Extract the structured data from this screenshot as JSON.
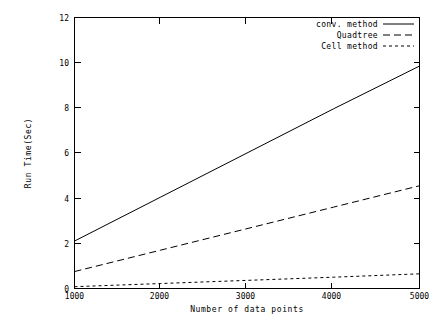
{
  "chart_data": {
    "type": "line",
    "title": "",
    "xlabel": "Number of data points",
    "ylabel": "Run Time(Sec)",
    "xlim": [
      1000,
      5000
    ],
    "ylim": [
      0,
      12
    ],
    "xticks": [
      1000,
      2000,
      3000,
      4000,
      5000
    ],
    "yticks": [
      0,
      2,
      4,
      6,
      8,
      10,
      12
    ],
    "xtick_labels": [
      "1000",
      "2000",
      "3000",
      "4000",
      "5000"
    ],
    "ytick_labels": [
      "0",
      "2",
      "4",
      "6",
      "8",
      "10",
      "12"
    ],
    "grid": false,
    "legend_position": "top-right",
    "x": [
      1000,
      2000,
      3000,
      4000,
      5000
    ],
    "series": [
      {
        "name": "conv. method",
        "style": "solid",
        "values": [
          2.1,
          4.05,
          6.0,
          7.95,
          9.85
        ]
      },
      {
        "name": "Quadtree",
        "style": "dashed",
        "values": [
          0.75,
          1.7,
          2.65,
          3.6,
          4.55
        ]
      },
      {
        "name": "Cell method",
        "style": "dotted",
        "values": [
          0.08,
          0.22,
          0.36,
          0.5,
          0.65
        ]
      }
    ]
  },
  "legend": {
    "entries": [
      {
        "label": "conv. method",
        "style": "solid"
      },
      {
        "label": "Quadtree",
        "style": "dashed"
      },
      {
        "label": "Cell method",
        "style": "dotted"
      }
    ]
  },
  "axes": {
    "x_title": "Number of data points",
    "y_title": "Run Time(Sec)"
  }
}
